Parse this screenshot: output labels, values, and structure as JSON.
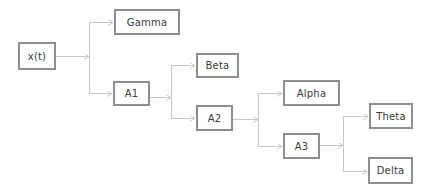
{
  "diagram": {
    "type": "tree",
    "colors": {
      "node_border": "#8e8e8e",
      "node_text": "#3a3a3a",
      "edge": "#c8c8c8",
      "background": "#ffffff"
    },
    "nodes": [
      {
        "id": "xt",
        "label": "x(t)",
        "x": 18,
        "y": 42,
        "w": 38,
        "h": 28
      },
      {
        "id": "gamma",
        "label": "Gamma",
        "x": 114,
        "y": 9,
        "w": 66,
        "h": 26
      },
      {
        "id": "a1",
        "label": "A1",
        "x": 113,
        "y": 81,
        "w": 37,
        "h": 25
      },
      {
        "id": "beta",
        "label": "Beta",
        "x": 196,
        "y": 53,
        "w": 43,
        "h": 25
      },
      {
        "id": "a2",
        "label": "A2",
        "x": 196,
        "y": 105,
        "w": 37,
        "h": 26
      },
      {
        "id": "alpha",
        "label": "Alpha",
        "x": 283,
        "y": 80,
        "w": 57,
        "h": 26
      },
      {
        "id": "a3",
        "label": "A3",
        "x": 283,
        "y": 133,
        "w": 37,
        "h": 26
      },
      {
        "id": "theta",
        "label": "Theta",
        "x": 369,
        "y": 103,
        "w": 44,
        "h": 26
      },
      {
        "id": "delta",
        "label": "Delta",
        "x": 368,
        "y": 157,
        "w": 45,
        "h": 27
      }
    ],
    "edges": [
      {
        "from": "xt",
        "to": [
          "gamma",
          "a1"
        ],
        "branch_x": 89,
        "source_y": 56,
        "targets_y": [
          22,
          93
        ]
      },
      {
        "from": "a1",
        "to": [
          "beta",
          "a2"
        ],
        "branch_x": 171,
        "source_y": 97,
        "targets_y": [
          65,
          118
        ]
      },
      {
        "from": "a2",
        "to": [
          "alpha",
          "a3"
        ],
        "branch_x": 258,
        "source_y": 119,
        "targets_y": [
          93,
          146
        ]
      },
      {
        "from": "a3",
        "to": [
          "theta",
          "delta"
        ],
        "branch_x": 343,
        "source_y": 145,
        "targets_y": [
          116,
          171
        ]
      }
    ]
  }
}
